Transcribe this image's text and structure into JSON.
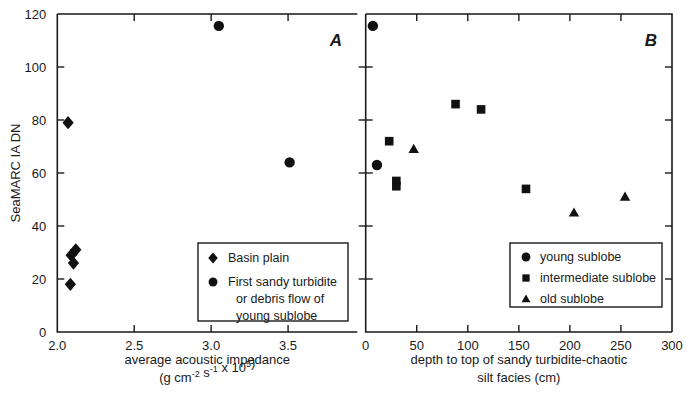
{
  "figure": {
    "background": "#ffffff",
    "ink_color": "#111111",
    "width": 690,
    "height": 399
  },
  "shared": {
    "ylabel": "SeaMARC IA DN",
    "y_ticks": [
      "0",
      "20",
      "40",
      "60",
      "80",
      "100",
      "120"
    ],
    "y_tick_values": [
      0,
      20,
      40,
      60,
      80,
      100,
      120
    ]
  },
  "panelA": {
    "letter": "A",
    "xlabel_line1": "average acoustic impedance",
    "xlabel_line2_pre": "(g cm",
    "xlabel_line2_sup1": "-2",
    "xlabel_line2_mid": " s",
    "xlabel_line2_sup2": "-1",
    "xlabel_line2_post": " x 10",
    "xlabel_line2_sup3": "5",
    "xlabel_line2_end": ")",
    "x_ticks": [
      "2.0",
      "2.5",
      "3.0",
      "3.5"
    ],
    "x_tick_values": [
      2.0,
      2.5,
      3.0,
      3.5
    ],
    "legend": [
      {
        "marker": "diamond",
        "label": "Basin plain"
      },
      {
        "marker": "circle",
        "label": "First sandy turbidite"
      },
      {
        "marker": "none",
        "label": "or debris flow of"
      },
      {
        "marker": "none",
        "label": "young sublobe"
      }
    ]
  },
  "panelB": {
    "letter": "B",
    "xlabel_line1": "depth to top of sandy turbidite-chaotic",
    "xlabel_line2": "silt facies (cm)",
    "x_ticks": [
      "0",
      "50",
      "100",
      "150",
      "200",
      "250",
      "300"
    ],
    "x_tick_values": [
      0,
      50,
      100,
      150,
      200,
      250,
      300
    ],
    "legend": [
      {
        "marker": "circle",
        "label": "young sublobe"
      },
      {
        "marker": "square",
        "label": "intermediate sublobe"
      },
      {
        "marker": "triangle",
        "label": "old sublobe"
      }
    ]
  },
  "chart_data": [
    {
      "type": "scatter",
      "panel": "A",
      "title": "A",
      "xlabel": "average acoustic impedance (g cm-2 s-1 x 10^5)",
      "ylabel": "SeaMARC IA DN",
      "xlim": [
        2.0,
        3.95
      ],
      "ylim": [
        0,
        120
      ],
      "grid": false,
      "legend_position": "lower-right",
      "series": [
        {
          "name": "Basin plain",
          "marker": "diamond",
          "points": [
            {
              "x": 2.07,
              "y": 79
            },
            {
              "x": 2.12,
              "y": 31
            },
            {
              "x": 2.09,
              "y": 29
            },
            {
              "x": 2.105,
              "y": 26
            },
            {
              "x": 2.085,
              "y": 18
            }
          ]
        },
        {
          "name": "First sandy turbidite or debris flow of young sublobe",
          "marker": "circle",
          "points": [
            {
              "x": 3.05,
              "y": 115.5
            },
            {
              "x": 3.51,
              "y": 64
            }
          ]
        }
      ]
    },
    {
      "type": "scatter",
      "panel": "B",
      "title": "B",
      "xlabel": "depth to top of sandy turbidite-chaotic silt facies (cm)",
      "ylabel": "SeaMARC IA DN",
      "xlim": [
        0,
        300
      ],
      "ylim": [
        0,
        120
      ],
      "grid": false,
      "legend_position": "lower-right",
      "series": [
        {
          "name": "young sublobe",
          "marker": "circle",
          "points": [
            {
              "x": 7,
              "y": 115.5
            },
            {
              "x": 11,
              "y": 63
            }
          ]
        },
        {
          "name": "intermediate sublobe",
          "marker": "square",
          "points": [
            {
              "x": 23,
              "y": 72
            },
            {
              "x": 30,
              "y": 57
            },
            {
              "x": 30,
              "y": 55
            },
            {
              "x": 88,
              "y": 86
            },
            {
              "x": 113,
              "y": 84
            },
            {
              "x": 157,
              "y": 54
            }
          ]
        },
        {
          "name": "old sublobe",
          "marker": "triangle",
          "points": [
            {
              "x": 47,
              "y": 69
            },
            {
              "x": 204,
              "y": 45
            },
            {
              "x": 254,
              "y": 51
            }
          ]
        }
      ]
    }
  ]
}
